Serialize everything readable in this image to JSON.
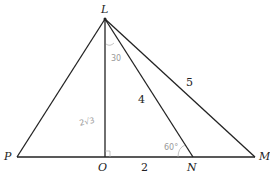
{
  "diagram": {
    "points": {
      "L": {
        "label": "L",
        "x": 105,
        "y": 19
      },
      "P": {
        "label": "P",
        "x": 17,
        "y": 157
      },
      "O": {
        "label": "O",
        "x": 105,
        "y": 157
      },
      "N": {
        "label": "N",
        "x": 193,
        "y": 157
      },
      "M": {
        "label": "M",
        "x": 255,
        "y": 157
      }
    },
    "segment_labels": {
      "LN": "4",
      "LM": "5",
      "ON": "2"
    },
    "annotations": {
      "LO": "2√3",
      "angle_OLN": "30",
      "angle_LNO": "60°",
      "right_angle_O": "⌐"
    },
    "colors": {
      "line": "#222222",
      "annotation": "#9a9a9a"
    }
  }
}
